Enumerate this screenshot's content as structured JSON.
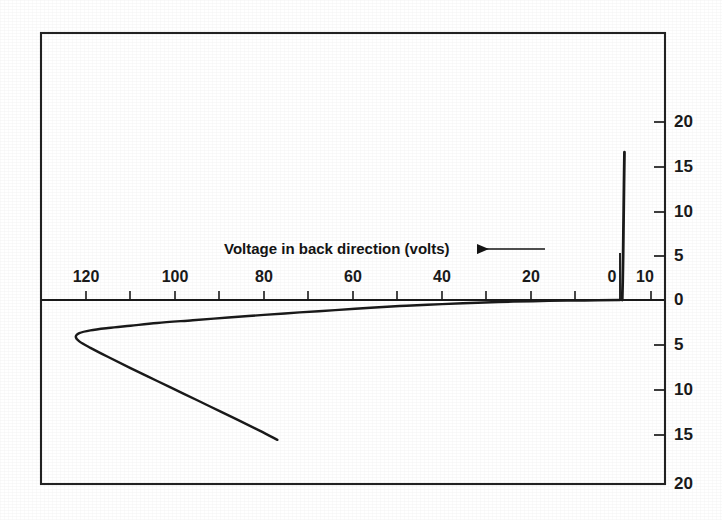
{
  "figure": {
    "background_color": "#ffffff",
    "ink_color": "#1a1a1a"
  },
  "chart_data": {
    "type": "line",
    "title": "",
    "subtitle": "",
    "xlabel": "Voltage in back direction (volts)",
    "ylabel": "",
    "x_axis": {
      "name": "voltage-axis",
      "label": "Voltage in back direction (volts)",
      "direction_marker": "left-arrow",
      "orientation": "reversed",
      "back_direction_ticks": [
        120,
        100,
        80,
        60,
        40,
        20,
        0
      ],
      "forward_direction_ticks": [
        10
      ],
      "tick_labels": [
        "120",
        "100",
        "80",
        "60",
        "40",
        "20",
        "0",
        "10"
      ],
      "minor_tick_interval": 10,
      "xlim": [
        130,
        -14
      ]
    },
    "y_axis": {
      "name": "current-axis",
      "label": "",
      "tick_labels_top_to_bottom": [
        "20",
        "15",
        "10",
        "5",
        "0",
        "5",
        "10",
        "15",
        "20"
      ],
      "upper_ticks": [
        20,
        15,
        10,
        5,
        0
      ],
      "lower_ticks": [
        5,
        10,
        15,
        20
      ],
      "ylim": [
        20,
        -20
      ],
      "minor_tick_interval": 5
    },
    "grid": false,
    "legend": null,
    "series": [
      {
        "name": "forward-spike",
        "description": "Near-vertical forward current rise at zero back voltage",
        "points": [
          [
            0.5,
            0.0
          ],
          [
            0.6,
            2.0
          ],
          [
            0.7,
            5.0
          ],
          [
            0.8,
            9.0
          ],
          [
            0.9,
            13.0
          ],
          [
            1.0,
            16.6
          ]
        ]
      },
      {
        "name": "back-characteristic",
        "description": "Reverse branch: current grows slowly with back voltage to a turning point near 122 V then folds back",
        "points": [
          [
            0.0,
            0.0
          ],
          [
            8.0,
            -0.05
          ],
          [
            16.0,
            -0.1
          ],
          [
            24.0,
            -0.18
          ],
          [
            32.0,
            -0.3
          ],
          [
            40.0,
            -0.45
          ],
          [
            48.0,
            -0.62
          ],
          [
            56.0,
            -0.85
          ],
          [
            64.0,
            -1.1
          ],
          [
            72.0,
            -1.35
          ],
          [
            80.0,
            -1.62
          ],
          [
            88.0,
            -1.9
          ],
          [
            96.0,
            -2.2
          ],
          [
            104.0,
            -2.5
          ],
          [
            110.0,
            -2.8
          ],
          [
            115.0,
            -3.05
          ],
          [
            119.0,
            -3.3
          ],
          [
            121.5,
            -3.6
          ],
          [
            122.3,
            -4.0
          ],
          [
            121.5,
            -4.5
          ],
          [
            119.0,
            -5.2
          ],
          [
            115.0,
            -6.2
          ],
          [
            110.0,
            -7.4
          ],
          [
            104.0,
            -8.8
          ],
          [
            98.0,
            -10.2
          ],
          [
            92.0,
            -11.6
          ],
          [
            86.0,
            -13.0
          ],
          [
            81.0,
            -14.2
          ],
          [
            77.0,
            -15.2
          ]
        ]
      }
    ],
    "annotations": [
      {
        "name": "x-axis-title-arrow",
        "text": "Voltage in back direction (volts)",
        "arrow": "left"
      }
    ]
  }
}
